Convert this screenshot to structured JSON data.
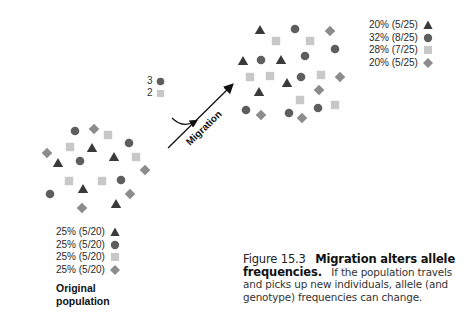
{
  "colors": {
    "triangle": "#3a3a3a",
    "circle": "#5e5e5e",
    "square": "#c8c8c8",
    "diamond": "#8c8c8c",
    "arrow": "#111111"
  },
  "original_population": {
    "title_line1": "Original",
    "title_line2": "population",
    "legend": [
      {
        "label": "25% (5/20)",
        "shape": "triangle"
      },
      {
        "label": "25% (5/20)",
        "shape": "circle"
      },
      {
        "label": "25% (5/20)",
        "shape": "square"
      },
      {
        "label": "25% (5/20)",
        "shape": "diamond"
      }
    ],
    "individuals": [
      {
        "shape": "circle",
        "x": 75,
        "y": 131
      },
      {
        "shape": "diamond",
        "x": 94,
        "y": 129
      },
      {
        "shape": "square",
        "x": 108,
        "y": 135
      },
      {
        "shape": "circle",
        "x": 129,
        "y": 143
      },
      {
        "shape": "square",
        "x": 70,
        "y": 147
      },
      {
        "shape": "triangle",
        "x": 92,
        "y": 148
      },
      {
        "shape": "triangle",
        "x": 114,
        "y": 157
      },
      {
        "shape": "square",
        "x": 136,
        "y": 157
      },
      {
        "shape": "diamond",
        "x": 47,
        "y": 153
      },
      {
        "shape": "triangle",
        "x": 58,
        "y": 163
      },
      {
        "shape": "circle",
        "x": 80,
        "y": 161
      },
      {
        "shape": "diamond",
        "x": 145,
        "y": 170
      },
      {
        "shape": "square",
        "x": 69,
        "y": 181
      },
      {
        "shape": "square",
        "x": 102,
        "y": 181
      },
      {
        "shape": "circle",
        "x": 121,
        "y": 180
      },
      {
        "shape": "triangle",
        "x": 83,
        "y": 189
      },
      {
        "shape": "circle",
        "x": 50,
        "y": 194
      },
      {
        "shape": "diamond",
        "x": 130,
        "y": 194
      },
      {
        "shape": "triangle",
        "x": 116,
        "y": 204
      },
      {
        "shape": "diamond",
        "x": 82,
        "y": 208
      }
    ]
  },
  "migrants": {
    "items": [
      {
        "count": "3",
        "shape": "circle"
      },
      {
        "count": "2",
        "shape": "square"
      }
    ],
    "arrow_label": "Migration"
  },
  "new_population": {
    "legend": [
      {
        "label": "20% (5/25)",
        "shape": "triangle"
      },
      {
        "label": "32% (8/25)",
        "shape": "circle"
      },
      {
        "label": "28% (7/25)",
        "shape": "square"
      },
      {
        "label": "20% (5/25)",
        "shape": "diamond"
      }
    ],
    "individuals": [
      {
        "shape": "triangle",
        "x": 260,
        "y": 30
      },
      {
        "shape": "circle",
        "x": 295,
        "y": 29
      },
      {
        "shape": "diamond",
        "x": 330,
        "y": 31
      },
      {
        "shape": "square",
        "x": 276,
        "y": 41
      },
      {
        "shape": "square",
        "x": 310,
        "y": 41
      },
      {
        "shape": "circle",
        "x": 335,
        "y": 49
      },
      {
        "shape": "triangle",
        "x": 243,
        "y": 61
      },
      {
        "shape": "circle",
        "x": 261,
        "y": 60
      },
      {
        "shape": "triangle",
        "x": 281,
        "y": 60
      },
      {
        "shape": "circle",
        "x": 305,
        "y": 56
      },
      {
        "shape": "square",
        "x": 250,
        "y": 77
      },
      {
        "shape": "square",
        "x": 270,
        "y": 76
      },
      {
        "shape": "triangle",
        "x": 287,
        "y": 83
      },
      {
        "shape": "circle",
        "x": 301,
        "y": 77
      },
      {
        "shape": "square",
        "x": 321,
        "y": 75
      },
      {
        "shape": "diamond",
        "x": 340,
        "y": 77
      },
      {
        "shape": "triangle",
        "x": 259,
        "y": 92
      },
      {
        "shape": "diamond",
        "x": 319,
        "y": 90
      },
      {
        "shape": "square",
        "x": 300,
        "y": 100
      },
      {
        "shape": "square",
        "x": 335,
        "y": 105
      },
      {
        "shape": "circle",
        "x": 246,
        "y": 110
      },
      {
        "shape": "diamond",
        "x": 261,
        "y": 115
      },
      {
        "shape": "circle",
        "x": 289,
        "y": 113
      },
      {
        "shape": "circle",
        "x": 318,
        "y": 108
      },
      {
        "shape": "diamond",
        "x": 302,
        "y": 118
      }
    ]
  },
  "caption": {
    "figure_label": "Figure 15.3",
    "title": "Migration alters allele frequencies.",
    "body": "If the population travels and picks up new individuals, allele (and genotype) frequencies can change."
  }
}
